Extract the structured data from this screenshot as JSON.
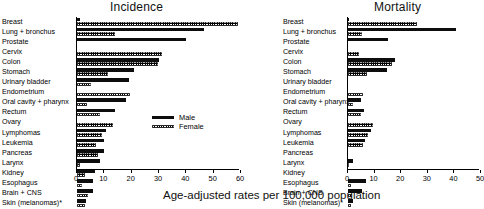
{
  "figure": {
    "xlabel": "Age-adjusted rates per 100,000 population",
    "legend": {
      "male": "Male",
      "female": "Female"
    },
    "panels": {
      "incidence": "Incidence",
      "mortality": "Mortality"
    }
  },
  "chart_data": {
    "type": "bar",
    "xlabel": "Age-adjusted rates per 100,000 population",
    "ylabel": "",
    "orientation": "horizontal",
    "grid": false,
    "legend_position": "center-left",
    "legend": [
      "Male",
      "Female"
    ],
    "categories": [
      "Breast",
      "Lung + bronchus",
      "Prostate",
      "Cervix",
      "Colon",
      "Stomach",
      "Urinary bladder",
      "Endometrium",
      "Oral cavity + pharynx",
      "Rectum",
      "Ovary",
      "Lymphomas",
      "Leukemia",
      "Pancreas",
      "Larynx",
      "Kidney",
      "Esophagus",
      "Brain + CNS",
      "Skin (melanomas)*"
    ],
    "panels": [
      {
        "name": "Incidence",
        "xlim": [
          0,
          60
        ],
        "xticks": [
          0,
          10,
          20,
          30,
          40,
          50,
          60
        ],
        "series": [
          {
            "name": "Male",
            "values": [
              1.0,
              46.5,
              40.0,
              0.0,
              30.0,
              21.0,
              19.0,
              0.0,
              18.0,
              14.0,
              0.0,
              10.7,
              10.0,
              10.0,
              8.4,
              6.6,
              6.0,
              6.0,
              3.4
            ]
          },
          {
            "name": "Female",
            "values": [
              59.0,
              14.0,
              0.0,
              31.0,
              29.5,
              11.5,
              5.0,
              19.5,
              3.7,
              8.5,
              13.2,
              9.2,
              7.0,
              7.5,
              1.0,
              3.0,
              2.0,
              4.2,
              2.8
            ]
          }
        ]
      },
      {
        "name": "Mortality",
        "xlim": [
          0,
          50
        ],
        "xticks": [
          0,
          10,
          20,
          30,
          40,
          50
        ],
        "series": [
          {
            "name": "Male",
            "values": [
              0.3,
              40.5,
              15.0,
              0.0,
              17.6,
              14.5,
              0.0,
              0.0,
              5.0,
              6.0,
              0.0,
              8.8,
              6.5,
              0.0,
              2.0,
              0.0,
              6.8,
              5.2,
              2.0
            ]
          },
          {
            "name": "Female",
            "values": [
              26.0,
              5.3,
              0.0,
              4.3,
              16.5,
              7.0,
              0.0,
              5.7,
              2.0,
              5.0,
              9.5,
              7.4,
              5.5,
              0.0,
              0.5,
              0.0,
              1.2,
              1.4,
              1.2
            ]
          }
        ]
      }
    ],
    "footnote": "*"
  }
}
